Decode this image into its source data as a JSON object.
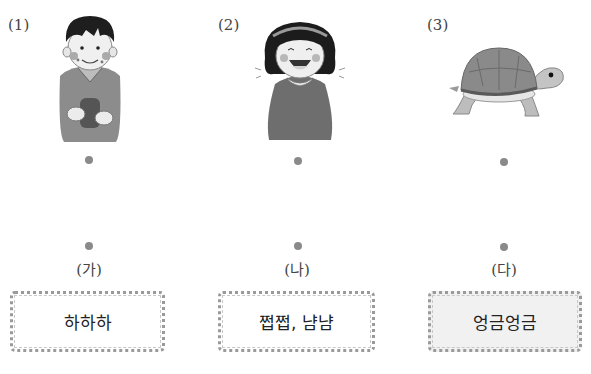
{
  "items": [
    {
      "number": "(1)",
      "picture": "boy-eating-icon",
      "picture_desc": "boy with crumbs on face eating"
    },
    {
      "number": "(2)",
      "picture": "girl-laughing-icon",
      "picture_desc": "girl laughing with open mouth"
    },
    {
      "number": "(3)",
      "picture": "turtle-icon",
      "picture_desc": "turtle crawling slowly"
    }
  ],
  "answers": [
    {
      "label": "(가)",
      "text": "하하하",
      "shaded": false
    },
    {
      "label": "(나)",
      "text": "쩝쩝, 냠냠",
      "shaded": false
    },
    {
      "label": "(다)",
      "text": "엉금엉금",
      "shaded": true
    }
  ],
  "colors": {
    "dot": "#8a8a8a",
    "card_border": "#9a9a9a",
    "card_shaded_bg": "#f1f1f1"
  }
}
